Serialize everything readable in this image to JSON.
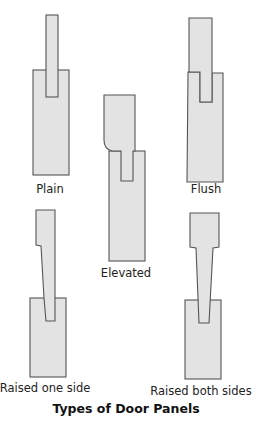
{
  "title": "Types of Door Panels",
  "colors": {
    "fill": "#e3e3e3",
    "stroke": "#555555",
    "background": "#ffffff"
  },
  "panels": [
    {
      "id": "plain",
      "label": "Plain",
      "label_x": 50,
      "label_y": 182
    },
    {
      "id": "elevated",
      "label": "Elevated",
      "label_x": 126,
      "label_y": 266
    },
    {
      "id": "flush",
      "label": "Flush",
      "label_x": 206,
      "label_y": 182
    },
    {
      "id": "raised-one-side",
      "label": "Raised one side",
      "label_x": 45,
      "label_y": 381
    },
    {
      "id": "raised-both-sides",
      "label": "Raised both sides",
      "label_x": 201,
      "label_y": 384
    }
  ],
  "title_pos": {
    "x": 126,
    "y": 402
  }
}
